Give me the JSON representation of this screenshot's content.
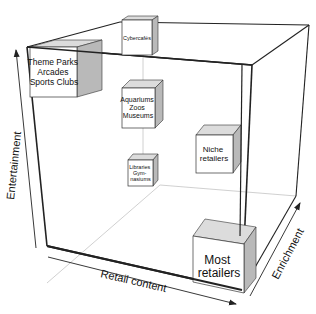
{
  "diagram": {
    "type": "3d-cube-positioning-map",
    "axes": {
      "x": "Retail content",
      "y": "Entertainment",
      "z": "Enrichment"
    },
    "boxes": [
      {
        "id": "theme-parks",
        "lines": [
          "Theme Parks",
          "Arcades",
          "Sports Clubs"
        ]
      },
      {
        "id": "cybercafes",
        "lines": [
          "Cybercafés"
        ]
      },
      {
        "id": "aquariums",
        "lines": [
          "Aquariums",
          "Zoos",
          "Museums"
        ]
      },
      {
        "id": "niche",
        "lines": [
          "Niche",
          "retailers"
        ]
      },
      {
        "id": "libraries",
        "lines": [
          "Libraries",
          "Gym-",
          "nasiums"
        ]
      },
      {
        "id": "most",
        "lines": [
          "Most",
          "retailers"
        ]
      }
    ],
    "colors": {
      "line": "#222222",
      "thin_line": "#bbbbbb",
      "box_front": "#ffffff",
      "box_top": "#dcdcdc",
      "box_side": "#b9b9b9"
    }
  }
}
